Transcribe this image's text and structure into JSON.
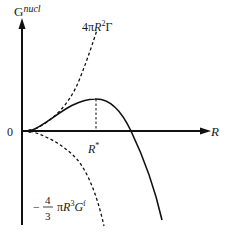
{
  "diagram": {
    "y_axis_label_main": "G",
    "y_axis_label_sup": "nucl",
    "x_axis_label": "R",
    "origin_label": "0",
    "critical_radius_label_main": "R",
    "critical_radius_label_sup": "*",
    "surface_term_label": {
      "prefix": "4π",
      "var": "R",
      "exp": "2",
      "suffix": "Γ"
    },
    "volume_term_label": {
      "sign": "−",
      "numerator": "4",
      "denominator": "3",
      "pi": "π",
      "var": "R",
      "exp": "3",
      "g": "G",
      "g_sup": "f"
    },
    "colors": {
      "line": "#111111",
      "background": "#ffffff"
    }
  }
}
